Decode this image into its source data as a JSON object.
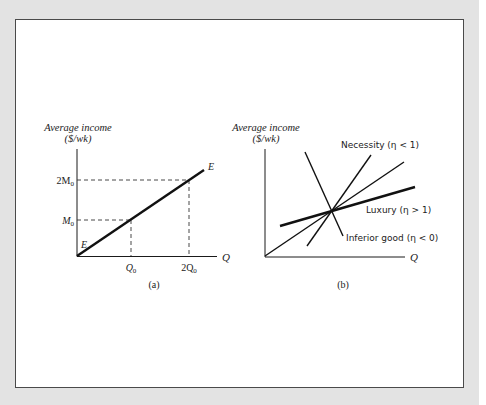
{
  "figure": {
    "panel_a": {
      "y_axis_label_line1": "Average income",
      "y_axis_label_line2": "($/wk)",
      "x_axis_label": "Q",
      "curve_label_start": "E",
      "curve_label_end": "E",
      "y_ticks": [
        {
          "main": "2M",
          "sub": "0"
        },
        {
          "main": "M",
          "sub": "0"
        }
      ],
      "x_ticks": [
        {
          "main": "Q",
          "sub": "0"
        },
        {
          "main": "2Q",
          "sub": "0"
        }
      ],
      "caption": "(a)"
    },
    "panel_b": {
      "y_axis_label_line1": "Average income",
      "y_axis_label_line2": "($/wk)",
      "x_axis_label": "Q",
      "curves": [
        {
          "name": "necessity",
          "label": "Necessity (η < 1)"
        },
        {
          "name": "luxury",
          "label": "Luxury (η > 1)"
        },
        {
          "name": "inferior",
          "label": "Inferior good (η < 0)"
        }
      ],
      "caption": "(b)"
    }
  },
  "colors": {
    "backdrop": "#e3e3e3",
    "frame_border": "#4a4a4a",
    "ink": "#1a1a1a"
  }
}
